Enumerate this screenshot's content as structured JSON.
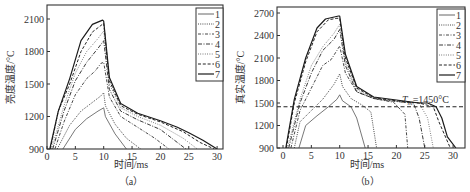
{
  "chart_data": [
    {
      "type": "line",
      "panel_label": "（a）",
      "title": "",
      "xlabel": "时间/ms",
      "ylabel": "亮度温度/°C",
      "xlim": [
        0,
        31
      ],
      "ylim": [
        900,
        2230
      ],
      "xticks": [
        0,
        5,
        10,
        15,
        20,
        25,
        30
      ],
      "yticks": [
        900,
        1200,
        1500,
        1800,
        2100
      ],
      "grid": false,
      "legend_position": "upper right",
      "series": [
        {
          "name": "1",
          "style": "solid-thin",
          "x": [
            2.8,
            5,
            7,
            9,
            10,
            10.3,
            12,
            14
          ],
          "y": [
            900,
            1080,
            1180,
            1250,
            1280,
            1200,
            1040,
            900
          ]
        },
        {
          "name": "2",
          "style": "dotted",
          "x": [
            1.8,
            4,
            6,
            8,
            9.5,
            10,
            10.3,
            12,
            14,
            16.5
          ],
          "y": [
            900,
            1120,
            1250,
            1330,
            1390,
            1420,
            1300,
            1130,
            1000,
            900
          ]
        },
        {
          "name": "3",
          "style": "dashdot",
          "x": [
            1.4,
            3,
            5,
            7,
            8.5,
            9.5,
            10,
            11,
            13,
            16,
            19,
            21.5
          ],
          "y": [
            900,
            1150,
            1400,
            1550,
            1620,
            1690,
            1700,
            1380,
            1200,
            1100,
            1000,
            900
          ]
        },
        {
          "name": "4",
          "style": "dashdot-long",
          "x": [
            1,
            3,
            5,
            7,
            9,
            10,
            11,
            13,
            16,
            20,
            23,
            24.5
          ],
          "y": [
            900,
            1250,
            1530,
            1700,
            1830,
            1900,
            1450,
            1250,
            1170,
            1080,
            960,
            900
          ]
        },
        {
          "name": "5",
          "style": "dotted-fine",
          "x": [
            0.8,
            3,
            5,
            7,
            9,
            10,
            11,
            13,
            16,
            20,
            24,
            26.5
          ],
          "y": [
            900,
            1300,
            1600,
            1800,
            1920,
            1990,
            1500,
            1280,
            1200,
            1120,
            1000,
            900
          ]
        },
        {
          "name": "6",
          "style": "dashed",
          "x": [
            0.6,
            2,
            4,
            6,
            8,
            9.5,
            10,
            11,
            13,
            16,
            20,
            24,
            27,
            29.5
          ],
          "y": [
            900,
            1250,
            1500,
            1800,
            1980,
            2040,
            2060,
            1530,
            1300,
            1220,
            1150,
            1060,
            960,
            900
          ]
        },
        {
          "name": "7",
          "style": "solid",
          "x": [
            0.5,
            2,
            4,
            6,
            8,
            9.8,
            10,
            11,
            13,
            16,
            20,
            23,
            25,
            27.5,
            30
          ],
          "y": [
            900,
            1250,
            1550,
            1900,
            2050,
            2090,
            2080,
            1560,
            1320,
            1230,
            1160,
            1100,
            1050,
            980,
            900
          ]
        }
      ]
    },
    {
      "type": "line",
      "panel_label": "（b）",
      "title": "",
      "xlabel": "时间/ms",
      "ylabel": "真实温度/°C",
      "xlim": [
        -0.5,
        32
      ],
      "ylim": [
        900,
        2780
      ],
      "xticks": [
        0,
        5,
        10,
        15,
        20,
        25,
        30
      ],
      "yticks": [
        900,
        1200,
        1500,
        1800,
        2100,
        2400,
        2700
      ],
      "grid": false,
      "legend_position": "upper right",
      "annotation": {
        "text_prefix": "T",
        "subscript": "m",
        "text_suffix": "=1450°C",
        "y": 1450,
        "style": "dashed-horizontal"
      },
      "series": [
        {
          "name": "1",
          "style": "solid-thin",
          "x": [
            2.8,
            4,
            6,
            8,
            9.5,
            10,
            10.5,
            12,
            13,
            14.5
          ],
          "y": [
            900,
            1200,
            1330,
            1450,
            1550,
            1610,
            1530,
            1450,
            1300,
            900
          ]
        },
        {
          "name": "2",
          "style": "dotted",
          "x": [
            2,
            3,
            5,
            7,
            9,
            10,
            10.5,
            12,
            14,
            15.5,
            16.5
          ],
          "y": [
            900,
            1250,
            1400,
            1550,
            1750,
            1890,
            1720,
            1560,
            1470,
            1380,
            900
          ]
        },
        {
          "name": "3",
          "style": "dashdot",
          "x": [
            1.4,
            3,
            5,
            7,
            8.5,
            9.5,
            10,
            11,
            13,
            16,
            19.5,
            21.5,
            22
          ],
          "y": [
            900,
            1400,
            1700,
            2000,
            2080,
            2200,
            2260,
            1900,
            1650,
            1560,
            1510,
            1350,
            900
          ]
        },
        {
          "name": "4",
          "style": "dashdot-long",
          "x": [
            1,
            3,
            5,
            7,
            9,
            10,
            11,
            13,
            16,
            20,
            23,
            24,
            25
          ],
          "y": [
            900,
            1500,
            1900,
            2200,
            2350,
            2480,
            2000,
            1650,
            1560,
            1520,
            1500,
            1300,
            900
          ]
        },
        {
          "name": "5",
          "style": "dotted-fine",
          "x": [
            0.8,
            3,
            5,
            7,
            9,
            10,
            11,
            13,
            16,
            20,
            24,
            25.5,
            26.5
          ],
          "y": [
            900,
            1550,
            2000,
            2250,
            2430,
            2550,
            2050,
            1680,
            1560,
            1520,
            1500,
            1300,
            900
          ]
        },
        {
          "name": "6",
          "style": "dashed",
          "x": [
            0.6,
            2,
            4,
            6,
            8,
            9.5,
            10,
            11,
            13,
            16,
            20,
            24,
            26.5,
            27.5,
            29.5
          ],
          "y": [
            900,
            1500,
            2050,
            2450,
            2610,
            2630,
            2630,
            2100,
            1700,
            1570,
            1530,
            1500,
            1450,
            1250,
            900
          ]
        },
        {
          "name": "7",
          "style": "solid",
          "x": [
            0.5,
            2,
            4,
            6,
            7.5,
            9.8,
            10,
            11,
            13,
            16,
            20,
            24,
            25.5,
            27,
            28,
            29,
            30.5
          ],
          "y": [
            900,
            1550,
            2100,
            2500,
            2620,
            2660,
            2660,
            2150,
            1720,
            1580,
            1540,
            1500,
            1500,
            1450,
            1300,
            1050,
            900
          ]
        }
      ]
    }
  ]
}
